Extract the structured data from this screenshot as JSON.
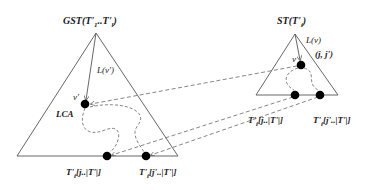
{
  "diagram": {
    "left_tree": {
      "title": "GST(T'1..T'l)",
      "title_parts": [
        "GST(T'",
        "1",
        "..T'",
        "l",
        ")"
      ],
      "edge_label": "L(v')",
      "node_label": "v'",
      "lca_label": "LCA",
      "leaf_labels": [
        {
          "pre": "T'",
          "sub": "i",
          "post": "[j..|T'|]"
        },
        {
          "pre": "T'",
          "sub": "i",
          "post": "[j'..|T'|]"
        }
      ]
    },
    "right_tree": {
      "title_parts": [
        "ST(T'",
        "i",
        ")"
      ],
      "edge_label": "L(v)",
      "node_label": "v",
      "range_label": "(j, j')",
      "leaf_labels": [
        {
          "pre": "T'",
          "sub": "i",
          "post": "[j..|T'|]"
        },
        {
          "pre": "T'",
          "sub": "i",
          "post": "[j'..|T'|]"
        }
      ]
    },
    "colors": {
      "line": "#555555",
      "node": "#000000",
      "dashed": "#666666"
    }
  }
}
